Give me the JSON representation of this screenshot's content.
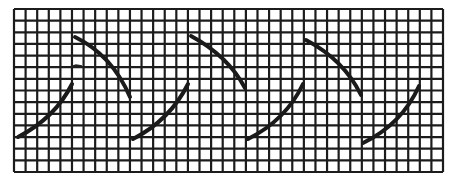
{
  "figure": {
    "background": "#ffffff",
    "ink_color": "#1a1a1a",
    "grid": {
      "left": 14,
      "right": 443,
      "top": 9,
      "bottom": 172,
      "columns": 37,
      "rows": 14
    },
    "curves": [
      {
        "name": "rise-1",
        "d": "M18,137 Q55,118 72,84"
      },
      {
        "name": "fall-1",
        "d": "M75,37 Q112,55 130,97"
      },
      {
        "name": "rise-2",
        "d": "M133,139 Q170,120 188,84"
      },
      {
        "name": "fall-2",
        "d": "M191,36 Q228,56 245,88"
      },
      {
        "name": "rise-3",
        "d": "M248,139 Q286,120 303,84"
      },
      {
        "name": "fall-3",
        "d": "M306,40 Q344,60 361,95"
      },
      {
        "name": "rise-4",
        "d": "M363,143 Q402,124 419,86"
      }
    ],
    "marks": [
      {
        "name": "small-tick-mark",
        "d": "M70,67 L76,65 L82,66"
      }
    ]
  }
}
